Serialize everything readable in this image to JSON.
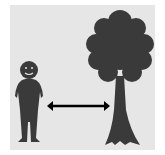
{
  "diagram": {
    "colors": {
      "background": "#ffffff",
      "panel": "#e6e6e6",
      "silhouette": "#3a3a3a",
      "arrow": "#000000",
      "face_features": "#e6e6e6"
    },
    "elements": [
      {
        "id": "person",
        "label": "person silhouette"
      },
      {
        "id": "arrow",
        "label": "double-headed distance arrow"
      },
      {
        "id": "tree",
        "label": "tree silhouette"
      }
    ]
  }
}
